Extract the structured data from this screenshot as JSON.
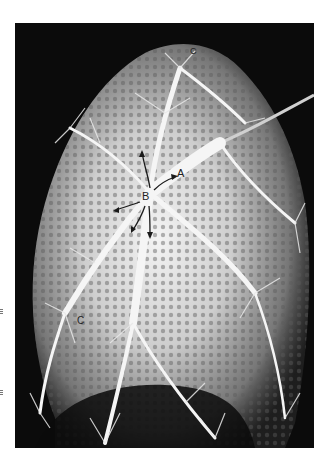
{
  "figure": {
    "labels": {
      "a": "A",
      "b": "B",
      "c_top": "C",
      "c_bottom": "C"
    },
    "colors": {
      "background": "#ffffff",
      "frame": "#0b0b0b",
      "vessels": "#f2f2f2"
    }
  }
}
